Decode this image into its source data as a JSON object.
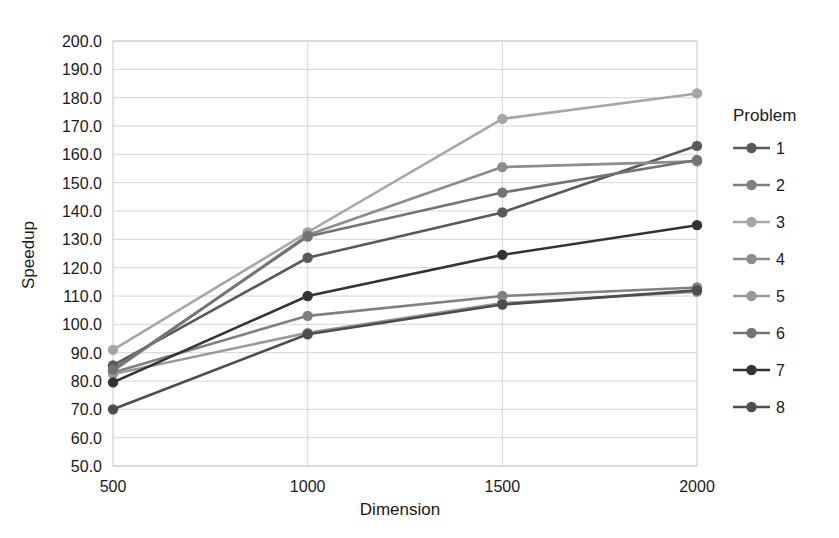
{
  "chart_data": {
    "type": "line",
    "title": "",
    "xlabel": "Dimension",
    "ylabel": "Speedup",
    "x": [
      500,
      1000,
      1500,
      2000
    ],
    "xtick_labels": [
      "500",
      "1000",
      "1500",
      "2000"
    ],
    "ytick_labels": [
      "50.0",
      "60.0",
      "70.0",
      "80.0",
      "90.0",
      "100.0",
      "110.0",
      "120.0",
      "130.0",
      "140.0",
      "150.0",
      "160.0",
      "170.0",
      "180.0",
      "190.0",
      "200.0"
    ],
    "ylim": [
      50.0,
      200.0
    ],
    "ytick_step": 10.0,
    "grid": true,
    "legend_position": "right",
    "legend_title": "Problem",
    "series": [
      {
        "name": "1",
        "values": [
          85.5,
          123.5,
          139.5,
          163.0
        ],
        "color": "#595959"
      },
      {
        "name": "2",
        "values": [
          83.0,
          103.0,
          110.0,
          113.0
        ],
        "color": "#808080"
      },
      {
        "name": "3",
        "values": [
          91.0,
          132.5,
          172.5,
          181.5
        ],
        "color": "#a6a6a6"
      },
      {
        "name": "4",
        "values": [
          83.5,
          131.5,
          155.5,
          157.5
        ],
        "color": "#8c8c8c"
      },
      {
        "name": "5",
        "values": [
          82.5,
          97.0,
          107.5,
          111.5
        ],
        "color": "#999999"
      },
      {
        "name": "6",
        "values": [
          84.0,
          131.0,
          146.5,
          158.0
        ],
        "color": "#737373"
      },
      {
        "name": "7",
        "values": [
          79.5,
          110.0,
          124.5,
          135.0
        ],
        "color": "#333333"
      },
      {
        "name": "8",
        "values": [
          70.0,
          96.5,
          107.0,
          112.0
        ],
        "color": "#4d4d4d"
      }
    ]
  },
  "legend": {
    "title": "Problem",
    "items": [
      {
        "label": "1"
      },
      {
        "label": "2"
      },
      {
        "label": "3"
      },
      {
        "label": "4"
      },
      {
        "label": "5"
      },
      {
        "label": "6"
      },
      {
        "label": "7"
      },
      {
        "label": "8"
      }
    ]
  },
  "axes": {
    "y_title": "Speedup",
    "x_title": "Dimension"
  }
}
